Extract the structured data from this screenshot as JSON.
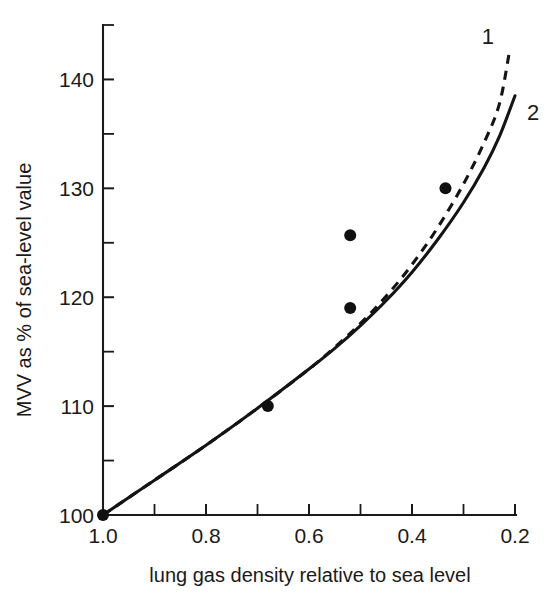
{
  "chart_data": {
    "type": "line",
    "title": "",
    "xlabel": "lung gas density relative to sea level",
    "ylabel": "MVV as % of sea-level value",
    "xlim": [
      1.0,
      0.2
    ],
    "ylim": [
      100,
      145
    ],
    "x_reversed": true,
    "grid": false,
    "legend_position": "inline-right-of-curve-ends",
    "xticks": [
      "1.0",
      "0.8",
      "0.6",
      "0.4",
      "0.2"
    ],
    "xtick_values": [
      1.0,
      0.8,
      0.6,
      0.4,
      0.2
    ],
    "xticks_minor": [
      0.9,
      0.7,
      0.5,
      0.3
    ],
    "yticks": [
      "100",
      "110",
      "120",
      "130",
      "140"
    ],
    "ytick_values": [
      100,
      110,
      120,
      130,
      140
    ],
    "yticks_minor": [
      105,
      115,
      125,
      135
    ],
    "series": [
      {
        "name": "1",
        "label": "1",
        "style": "dashed",
        "x": [
          1.0,
          0.9,
          0.8,
          0.7,
          0.6,
          0.55,
          0.5,
          0.45,
          0.4,
          0.35,
          0.3,
          0.26,
          0.23,
          0.21
        ],
        "values": [
          100.0,
          103.2,
          106.4,
          109.8,
          113.4,
          115.4,
          117.6,
          120.1,
          123.0,
          126.4,
          130.4,
          134.2,
          137.8,
          142.8
        ]
      },
      {
        "name": "2",
        "label": "2",
        "style": "solid",
        "x": [
          1.0,
          0.9,
          0.8,
          0.7,
          0.6,
          0.55,
          0.5,
          0.45,
          0.4,
          0.35,
          0.3,
          0.26,
          0.23,
          0.2
        ],
        "values": [
          100.0,
          103.2,
          106.4,
          109.8,
          113.4,
          115.3,
          117.4,
          119.7,
          122.3,
          125.3,
          128.7,
          131.9,
          134.8,
          138.5
        ]
      }
    ],
    "points": {
      "name": "measured data points",
      "x": [
        1.0,
        0.68,
        0.52,
        0.52,
        0.335
      ],
      "values": [
        100.0,
        110.0,
        119.0,
        125.7,
        130.0
      ]
    }
  },
  "labels": {
    "series_1": "1",
    "series_2": "2"
  }
}
